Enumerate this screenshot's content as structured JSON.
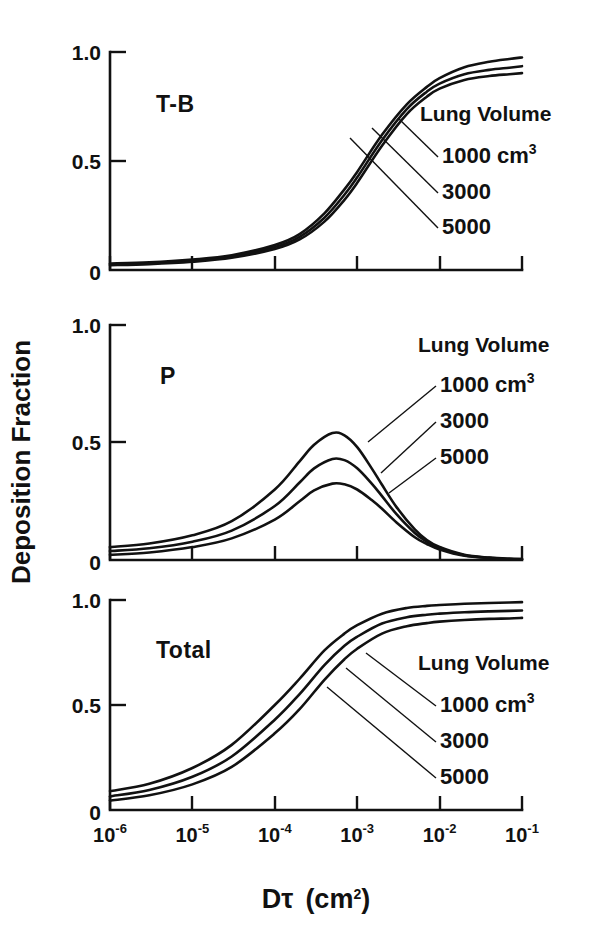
{
  "figure": {
    "y_axis_title": "Deposition Fraction",
    "x_axis_title_base": "D",
    "x_axis_title_tau": "τ",
    "x_axis_title_units": "(cm",
    "x_axis_title_units_exp": "2",
    "x_axis_title_units_close": ")",
    "background_color": "#ffffff",
    "ink_color": "#111111"
  },
  "axes": {
    "y_ticks": [
      "1.0",
      "0.5",
      "0"
    ],
    "y_tick_values": [
      1.0,
      0.5,
      0.0
    ],
    "x_tick_mantissa": "10",
    "x_tick_exponents": [
      "-6",
      "-5",
      "-4",
      "-3",
      "-2",
      "-1"
    ],
    "x_tick_values": [
      1e-06,
      1e-05,
      0.0001,
      0.001,
      0.01,
      0.1
    ]
  },
  "legend": {
    "title": "Lung Volume",
    "entries": [
      {
        "value": "1000",
        "unit": "cm",
        "unit_exp": "3"
      },
      {
        "value": "3000",
        "unit": "",
        "unit_exp": ""
      },
      {
        "value": "5000",
        "unit": "",
        "unit_exp": ""
      }
    ]
  },
  "chart_data": {
    "type": "line",
    "title": "",
    "xlabel": "Dτ (cm²)",
    "ylabel": "Deposition Fraction",
    "xscale": "log",
    "xlim": [
      1e-06,
      0.1
    ],
    "ylim": [
      0,
      1
    ],
    "grid": false,
    "legend_position": "inside-right",
    "legend_title": "Lung Volume",
    "panels": [
      {
        "label": "T-B",
        "name": "tracheobronchial",
        "yticks": [
          0,
          0.5,
          1.0
        ],
        "series": [
          {
            "name": "1000 cm3",
            "x": [
              1e-06,
              3e-06,
              1e-05,
              3e-05,
              0.0001,
              0.0002,
              0.0004,
              0.0007,
              0.001,
              0.002,
              0.004,
              0.007,
              0.01,
              0.02,
              0.04,
              0.07,
              0.1
            ],
            "y": [
              0.03,
              0.035,
              0.048,
              0.068,
              0.115,
              0.165,
              0.26,
              0.37,
              0.45,
              0.62,
              0.76,
              0.84,
              0.88,
              0.93,
              0.955,
              0.968,
              0.975
            ]
          },
          {
            "name": "3000",
            "x": [
              1e-06,
              3e-06,
              1e-05,
              3e-05,
              0.0001,
              0.0002,
              0.0004,
              0.0007,
              0.001,
              0.002,
              0.004,
              0.007,
              0.01,
              0.02,
              0.04,
              0.07,
              0.1
            ],
            "y": [
              0.026,
              0.031,
              0.043,
              0.062,
              0.105,
              0.152,
              0.24,
              0.345,
              0.425,
              0.595,
              0.738,
              0.818,
              0.855,
              0.898,
              0.918,
              0.928,
              0.935
            ]
          },
          {
            "name": "5000",
            "x": [
              1e-06,
              3e-06,
              1e-05,
              3e-05,
              0.0001,
              0.0002,
              0.0004,
              0.0007,
              0.001,
              0.002,
              0.004,
              0.007,
              0.01,
              0.02,
              0.04,
              0.07,
              0.1
            ],
            "y": [
              0.022,
              0.027,
              0.038,
              0.056,
              0.096,
              0.14,
              0.222,
              0.322,
              0.4,
              0.57,
              0.715,
              0.795,
              0.832,
              0.872,
              0.89,
              0.898,
              0.903
            ]
          }
        ]
      },
      {
        "label": "P",
        "name": "pulmonary",
        "yticks": [
          0,
          0.5,
          1.0
        ],
        "series": [
          {
            "name": "1000 cm3",
            "x": [
              1e-06,
              3e-06,
              1e-05,
              3e-05,
              0.0001,
              0.0002,
              0.0003,
              0.0005,
              0.0007,
              0.001,
              0.0015,
              0.002,
              0.003,
              0.005,
              0.007,
              0.01,
              0.02,
              0.04,
              0.07,
              0.1
            ],
            "y": [
              0.055,
              0.07,
              0.105,
              0.165,
              0.3,
              0.42,
              0.49,
              0.54,
              0.53,
              0.48,
              0.39,
              0.32,
              0.225,
              0.13,
              0.085,
              0.055,
              0.022,
              0.01,
              0.005,
              0.004
            ]
          },
          {
            "name": "3000",
            "x": [
              1e-06,
              3e-06,
              1e-05,
              3e-05,
              0.0001,
              0.0002,
              0.0003,
              0.0005,
              0.0007,
              0.001,
              0.0015,
              0.002,
              0.003,
              0.005,
              0.007,
              0.01,
              0.02,
              0.04,
              0.07,
              0.1
            ],
            "y": [
              0.038,
              0.05,
              0.078,
              0.125,
              0.23,
              0.33,
              0.39,
              0.43,
              0.425,
              0.39,
              0.325,
              0.272,
              0.195,
              0.115,
              0.078,
              0.05,
              0.02,
              0.009,
              0.005,
              0.004
            ]
          },
          {
            "name": "5000",
            "x": [
              1e-06,
              3e-06,
              1e-05,
              3e-05,
              0.0001,
              0.0002,
              0.0003,
              0.0005,
              0.0007,
              0.001,
              0.0015,
              0.002,
              0.003,
              0.005,
              0.007,
              0.01,
              0.02,
              0.04,
              0.07,
              0.1
            ],
            "y": [
              0.022,
              0.032,
              0.055,
              0.092,
              0.172,
              0.25,
              0.296,
              0.325,
              0.322,
              0.3,
              0.255,
              0.218,
              0.16,
              0.097,
              0.068,
              0.045,
              0.018,
              0.008,
              0.004,
              0.003
            ]
          }
        ]
      },
      {
        "label": "Total",
        "name": "total",
        "yticks": [
          0,
          0.5,
          1.0
        ],
        "series": [
          {
            "name": "1000 cm3",
            "x": [
              1e-06,
              3e-06,
              1e-05,
              3e-05,
              0.0001,
              0.0002,
              0.0004,
              0.0007,
              0.001,
              0.002,
              0.004,
              0.007,
              0.01,
              0.02,
              0.04,
              0.07,
              0.1
            ],
            "y": [
              0.09,
              0.125,
              0.2,
              0.31,
              0.5,
              0.625,
              0.76,
              0.84,
              0.88,
              0.935,
              0.962,
              0.972,
              0.976,
              0.982,
              0.986,
              0.988,
              0.99
            ]
          },
          {
            "name": "3000",
            "x": [
              1e-06,
              3e-06,
              1e-05,
              3e-05,
              0.0001,
              0.0002,
              0.0004,
              0.0007,
              0.001,
              0.002,
              0.004,
              0.007,
              0.01,
              0.02,
              0.04,
              0.07,
              0.1
            ],
            "y": [
              0.065,
              0.095,
              0.158,
              0.255,
              0.43,
              0.552,
              0.69,
              0.782,
              0.825,
              0.888,
              0.918,
              0.93,
              0.935,
              0.942,
              0.946,
              0.948,
              0.95
            ]
          },
          {
            "name": "5000",
            "x": [
              1e-06,
              3e-06,
              1e-05,
              3e-05,
              0.0001,
              0.0002,
              0.0004,
              0.0007,
              0.001,
              0.002,
              0.004,
              0.007,
              0.01,
              0.02,
              0.04,
              0.07,
              0.1
            ],
            "y": [
              0.045,
              0.07,
              0.122,
              0.205,
              0.365,
              0.48,
              0.62,
              0.718,
              0.768,
              0.84,
              0.875,
              0.89,
              0.897,
              0.905,
              0.91,
              0.912,
              0.915
            ]
          }
        ]
      }
    ]
  },
  "layout": {
    "plot_left": 110,
    "plot_right": 522,
    "panel_tops": [
      52,
      325,
      600
    ],
    "panel_bottoms": [
      270,
      560,
      810
    ]
  }
}
